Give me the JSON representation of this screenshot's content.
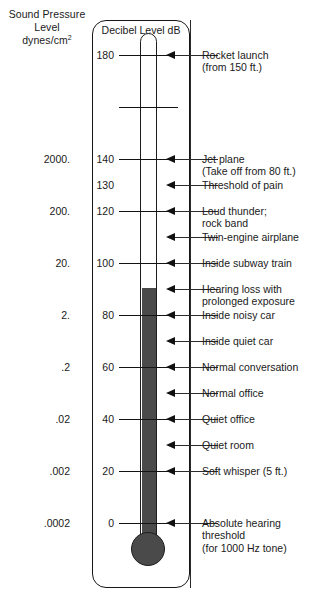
{
  "left_header": {
    "line1": "Sound Pressure",
    "line2": "Level",
    "line3_main": "dynes/cm",
    "line3_sup": "2"
  },
  "scale_title": "Decibel Level dB",
  "sound_pressure_values": [
    {
      "text": "2000.",
      "db": 140
    },
    {
      "text": "200.",
      "db": 120
    },
    {
      "text": "20.",
      "db": 100
    },
    {
      "text": "2.",
      "db": 80
    },
    {
      "text": ".2",
      "db": 60
    },
    {
      "text": ".02",
      "db": 40
    },
    {
      "text": ".002",
      "db": 20
    },
    {
      "text": ".0002",
      "db": 0
    }
  ],
  "decibel_ticks": [
    {
      "label": "180",
      "db": 180,
      "major": true
    },
    {
      "label": "",
      "db": 160,
      "major": true
    },
    {
      "label": "140",
      "db": 140,
      "major": true
    },
    {
      "label": "130",
      "db": 130,
      "major": false
    },
    {
      "label": "120",
      "db": 120,
      "major": true
    },
    {
      "label": "100",
      "db": 100,
      "major": true
    },
    {
      "label": "80",
      "db": 80,
      "major": true
    },
    {
      "label": "60",
      "db": 60,
      "major": true
    },
    {
      "label": "40",
      "db": 40,
      "major": true
    },
    {
      "label": "20",
      "db": 20,
      "major": true
    },
    {
      "label": "0",
      "db": 0,
      "major": true
    }
  ],
  "annotations": [
    {
      "db": 180,
      "lines": [
        "Rocket launch",
        "(from 150 ft.)"
      ]
    },
    {
      "db": 140,
      "lines": [
        "Jet plane",
        "(Take off from 80 ft.)"
      ]
    },
    {
      "db": 130,
      "lines": [
        "Threshold of pain"
      ]
    },
    {
      "db": 120,
      "lines": [
        "Loud thunder;",
        "rock band"
      ]
    },
    {
      "db": 110,
      "lines": [
        "Twin-engine airplane"
      ]
    },
    {
      "db": 100,
      "lines": [
        "Inside subway train"
      ]
    },
    {
      "db": 90,
      "lines": [
        "Hearing loss with",
        "prolonged exposure"
      ]
    },
    {
      "db": 80,
      "lines": [
        "Inside noisy car"
      ]
    },
    {
      "db": 70,
      "lines": [
        "Inside quiet car"
      ]
    },
    {
      "db": 60,
      "lines": [
        "Normal conversation"
      ]
    },
    {
      "db": 50,
      "lines": [
        "Normal office"
      ]
    },
    {
      "db": 40,
      "lines": [
        "Quiet office"
      ]
    },
    {
      "db": 30,
      "lines": [
        "Quiet room"
      ]
    },
    {
      "db": 20,
      "lines": [
        "Soft whisper (5 ft.)"
      ]
    },
    {
      "db": 0,
      "lines": [
        "Absolute hearing",
        "threshold",
        "(for 1000 Hz tone)"
      ]
    }
  ],
  "chart_data": {
    "type": "bar",
    "title": "Decibel Level dB",
    "xlabel": "",
    "ylabel": "Decibel Level dB",
    "ylim": [
      0,
      180
    ],
    "grid": false,
    "legend": "none",
    "categories": [
      "Absolute hearing threshold (for 1000 Hz tone)",
      "Soft whisper (5 ft.)",
      "Quiet room",
      "Quiet office",
      "Normal office",
      "Normal conversation",
      "Inside quiet car",
      "Inside noisy car",
      "Hearing loss with prolonged exposure",
      "Inside subway train",
      "Twin-engine airplane",
      "Loud thunder; rock band",
      "Threshold of pain",
      "Jet plane (Take off from 80 ft.)",
      "Rocket launch (from 150 ft.)"
    ],
    "values": [
      0,
      20,
      30,
      40,
      50,
      60,
      70,
      80,
      90,
      100,
      110,
      120,
      130,
      140,
      180
    ],
    "secondary_axis": {
      "label": "Sound Pressure Level dynes/cm2",
      "tick_db": [
        0,
        20,
        40,
        60,
        80,
        100,
        120,
        140
      ],
      "tick_labels": [
        ".0002",
        ".002",
        ".02",
        ".2",
        "2.",
        "20.",
        "200.",
        "2000."
      ]
    },
    "annotations": [
      "Rocket launch (from 150 ft.) = 180 dB",
      "Jet plane (Take off from 80 ft.) = 140 dB",
      "Threshold of pain = 130 dB",
      "Loud thunder; rock band = 120 dB",
      "Twin-engine airplane = 110 dB",
      "Inside subway train = 100 dB",
      "Hearing loss with prolonged exposure = 90 dB",
      "Inside noisy car = 80 dB",
      "Inside quiet car = 70 dB",
      "Normal conversation = 60 dB",
      "Normal office = 50 dB",
      "Quiet office = 40 dB",
      "Quiet room = 30 dB",
      "Soft whisper (5 ft.) = 20 dB",
      "Absolute hearing threshold (for 1000 Hz tone) = 0 dB"
    ],
    "mercury_top_db": 91
  }
}
